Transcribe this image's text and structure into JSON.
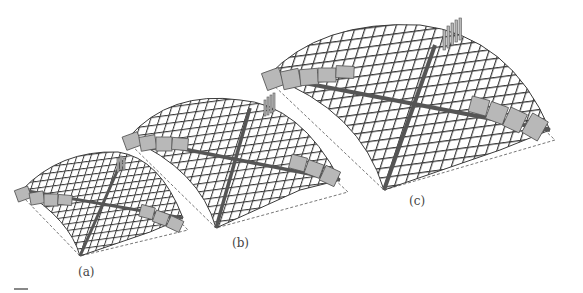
{
  "figure": {
    "panels": [
      {
        "id": "a",
        "label": "(a)",
        "scale": "small"
      },
      {
        "id": "b",
        "label": "(b)",
        "scale": "medium"
      },
      {
        "id": "c",
        "label": "(c)",
        "scale": "large"
      }
    ],
    "colors": {
      "grid_line": "#3a3a3a",
      "tile_fill": "#b8b8b8",
      "tile_stroke": "#555555",
      "footprint_dash": "#777777",
      "label": "#444444"
    }
  }
}
